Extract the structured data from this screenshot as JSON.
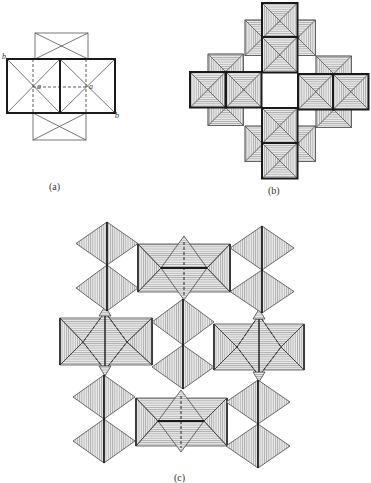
{
  "figure": {
    "panels": [
      {
        "id": "a",
        "label": "(a)",
        "label_pos": [
          56,
          187
        ]
      },
      {
        "id": "b",
        "label": "(b)",
        "label_pos": [
          275,
          191
        ]
      },
      {
        "id": "c",
        "label": "(c)",
        "label_pos": [
          181,
          478
        ]
      }
    ],
    "axis_labels": [
      {
        "text": "b",
        "pos": [
          2,
          58
        ]
      },
      {
        "text": "a",
        "pos": [
          38,
          89
        ]
      },
      {
        "text": "a",
        "pos": [
          90,
          89
        ]
      },
      {
        "text": "b",
        "pos": [
          115,
          117
        ]
      }
    ],
    "colors": {
      "line": "#1a1a1a",
      "hatch": "#555555",
      "fill": "#e6e6e6",
      "thin": "#444444"
    }
  },
  "panel_a": {
    "top_square": [
      35,
      33,
      88,
      59
    ],
    "bottom_square": [
      33,
      113,
      86,
      140
    ],
    "main_rect": [
      7,
      59,
      115,
      113
    ],
    "divider_x": 60,
    "dashed_v": [
      33,
      86
    ],
    "dashed_h_y": 87
  },
  "panel_b": {
    "size": 35.5,
    "front_squares": [
      [
        262,
        3
      ],
      [
        262,
        37
      ],
      [
        190,
        72
      ],
      [
        226,
        72
      ],
      [
        298,
        74
      ],
      [
        333,
        74
      ],
      [
        262,
        108
      ],
      [
        262,
        143
      ]
    ],
    "back_squares": [
      [
        245,
        20
      ],
      [
        280,
        20
      ],
      [
        208,
        54
      ],
      [
        316,
        56
      ],
      [
        208,
        90
      ],
      [
        316,
        92
      ],
      [
        245,
        126
      ],
      [
        280,
        126
      ]
    ]
  },
  "panel_c": {
    "octa_pairs": [
      {
        "x": 107,
        "top": 222,
        "mid": 265,
        "bot": 311,
        "hw": 31
      },
      {
        "x": 262,
        "top": 226,
        "mid": 270,
        "bot": 313,
        "hw": 32
      },
      {
        "x": 183,
        "top": 299,
        "mid": 345,
        "bot": 389,
        "hw": 31
      },
      {
        "x": 104,
        "top": 375,
        "mid": 419,
        "bot": 463,
        "hw": 31
      },
      {
        "x": 258,
        "top": 380,
        "mid": 424,
        "bot": 468,
        "hw": 32
      }
    ],
    "blocks": [
      {
        "rect": [
          138,
          244,
          230,
          292
        ],
        "cx": 184,
        "cy": 268,
        "dtop": 236,
        "dbot": 300,
        "dhw": 23,
        "style": "h"
      },
      {
        "rect": [
          60,
          318,
          152,
          365
        ],
        "cx": 105,
        "cy": 342,
        "dtop": 312,
        "dbot": 370,
        "dhw": 22,
        "style": "v"
      },
      {
        "rect": [
          214,
          324,
          304,
          370
        ],
        "cx": 259,
        "cy": 347,
        "dtop": 315,
        "dbot": 376,
        "dhw": 22,
        "style": "v"
      },
      {
        "rect": [
          136,
          398,
          227,
          446
        ],
        "cx": 181,
        "cy": 421,
        "dtop": 390,
        "dbot": 452,
        "dhw": 23,
        "style": "h"
      }
    ]
  }
}
